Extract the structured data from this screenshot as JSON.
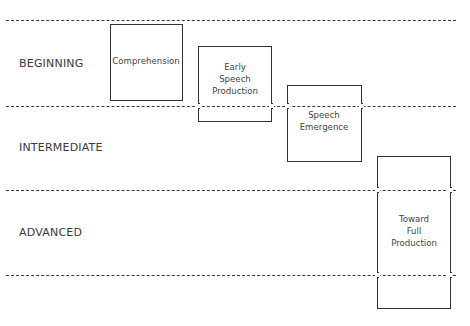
{
  "diagram": {
    "type": "stage-progression",
    "levels": [
      {
        "id": "beginning",
        "label": "BEGINNING",
        "y": 63
      },
      {
        "id": "intermediate",
        "label": "INTERMEDIATE",
        "y": 147
      },
      {
        "id": "advanced",
        "label": "ADVANCED",
        "y": 232
      }
    ],
    "dividers_y": [
      20,
      106,
      190,
      275
    ],
    "stages": [
      {
        "id": "comprehension",
        "label": "Comprehension",
        "x": 110,
        "y": 24,
        "w": 73,
        "h": 77,
        "label_y": 61
      },
      {
        "id": "early-speech-production",
        "label": "Early\nSpeech\nProduction",
        "x": 198,
        "y": 46,
        "w": 74,
        "h": 76,
        "label_y": 79
      },
      {
        "id": "speech-emergence",
        "label": "Speech\nEmergence",
        "x": 287,
        "y": 85,
        "w": 75,
        "h": 77,
        "label_y": 121
      },
      {
        "id": "toward-full-production",
        "label": "Toward\nFull\nProduction",
        "x": 377,
        "y": 156,
        "w": 74,
        "h": 153,
        "label_y": 231
      }
    ]
  }
}
